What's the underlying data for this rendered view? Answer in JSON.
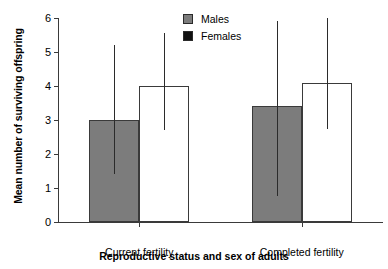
{
  "chart_data": {
    "type": "bar",
    "title": "",
    "xlabel": "Reproductive status and sex of adults",
    "ylabel": "Mean number of surviving offspring",
    "categories": [
      "Current fertility",
      "Completed fertility"
    ],
    "ylim": [
      0,
      6
    ],
    "yticks": [
      0,
      1,
      2,
      3,
      4,
      5,
      6
    ],
    "ytick_labels": [
      "0",
      "1",
      "2",
      "3",
      "4",
      "5",
      "6"
    ],
    "grid": false,
    "legend_position": "top-right",
    "series": [
      {
        "name": "Males",
        "color": "#7c7c7c",
        "legend_swatch_color": "#7c7c7c",
        "values": [
          3.0,
          3.4
        ],
        "err_low": [
          1.4,
          0.75
        ],
        "err_high": [
          5.2,
          5.9
        ]
      },
      {
        "name": "Females",
        "color": "#ffffff",
        "legend_swatch_color": "#111111",
        "values": [
          4.0,
          4.1
        ],
        "err_low": [
          2.7,
          2.75
        ],
        "err_high": [
          5.55,
          6.2
        ]
      }
    ]
  },
  "legend": {
    "items": [
      {
        "label": "Males"
      },
      {
        "label": "Females"
      }
    ]
  },
  "axis": {
    "y_title": "Mean number of surviving offspring",
    "x_title": "Reproductive status and sex of adults"
  }
}
